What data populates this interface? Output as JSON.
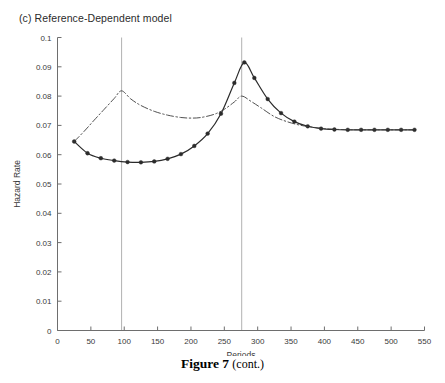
{
  "panel": {
    "title": "(c) Reference-Dependent model"
  },
  "caption": {
    "label": "Figure 7",
    "suffix": "(cont.)"
  },
  "colors": {
    "solid_series": "#2b2b2b",
    "dashdot_series": "#3c3c3c",
    "axis": "#6e6e6e",
    "reference_line": "#b8b8b8",
    "text": "#3a3a3a",
    "background": "#ffffff"
  },
  "chart_data": {
    "type": "line",
    "title": "(c) Reference-Dependent model",
    "xlabel": "Periods",
    "ylabel": "Hazard Rate",
    "xlim": [
      0,
      550
    ],
    "ylim": [
      0,
      0.1
    ],
    "xticks": [
      0,
      50,
      100,
      150,
      200,
      250,
      300,
      350,
      400,
      450,
      500,
      550
    ],
    "xticklabels": [
      "0",
      "50",
      "100",
      "150",
      "200",
      "250",
      "300",
      "350",
      "400",
      "450",
      "500",
      "550"
    ],
    "yticks": [
      0,
      0.01,
      0.02,
      0.03,
      0.04,
      0.05,
      0.06,
      0.07,
      0.08,
      0.09,
      0.1
    ],
    "yticklabels": [
      "0",
      "0.01",
      "0.02",
      "0.03",
      "0.04",
      "0.05",
      "0.06",
      "0.07",
      "0.08",
      "0.09",
      "0.1"
    ],
    "grid": false,
    "legend": "none",
    "annotations": [
      {
        "name": "reference-line-1",
        "type": "vline",
        "x": 96
      },
      {
        "name": "reference-line-2",
        "type": "vline",
        "x": 276
      }
    ],
    "series": [
      {
        "name": "hazard-rate-with-markers",
        "style": "solid",
        "marker": "circle",
        "x": [
          25,
          45,
          65,
          85,
          105,
          125,
          145,
          165,
          185,
          205,
          225,
          245,
          265,
          280,
          295,
          315,
          335,
          355,
          375,
          395,
          415,
          435,
          455,
          475,
          495,
          515,
          535
        ],
        "y": [
          0.0645,
          0.0605,
          0.0588,
          0.058,
          0.0575,
          0.0574,
          0.0577,
          0.0586,
          0.0602,
          0.063,
          0.0672,
          0.074,
          0.0845,
          0.0915,
          0.0862,
          0.079,
          0.0742,
          0.0713,
          0.0697,
          0.0689,
          0.0686,
          0.0685,
          0.0685,
          0.0685,
          0.0685,
          0.0685,
          0.0685
        ]
      },
      {
        "name": "hazard-rate-reference",
        "style": "dashdot",
        "marker": "none",
        "x": [
          25,
          40,
          55,
          70,
          85,
          96,
          110,
          125,
          145,
          165,
          185,
          200,
          215,
          235,
          250,
          265,
          276,
          290,
          305,
          325,
          345,
          365,
          385,
          405,
          425,
          455,
          495,
          535
        ],
        "y": [
          0.0645,
          0.068,
          0.0718,
          0.0755,
          0.0792,
          0.0818,
          0.079,
          0.0768,
          0.0748,
          0.0735,
          0.0727,
          0.0725,
          0.0727,
          0.0738,
          0.0755,
          0.078,
          0.08,
          0.0782,
          0.076,
          0.073,
          0.0712,
          0.07,
          0.0693,
          0.0688,
          0.0686,
          0.0685,
          0.0685,
          0.0685
        ]
      }
    ]
  }
}
